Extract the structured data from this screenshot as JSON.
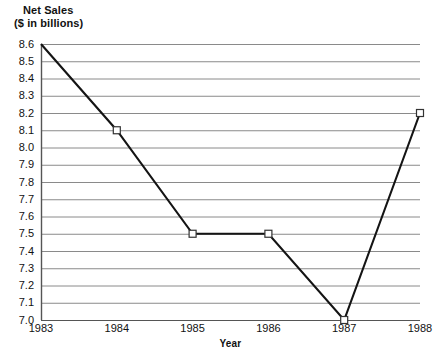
{
  "chart_data": {
    "type": "line",
    "title": "Net Sales ($ in billions)",
    "title_line1": "Net Sales",
    "title_line2": "($ in billions)",
    "xlabel": "Year",
    "ylabel": "",
    "categories": [
      "1983",
      "1984",
      "1985",
      "1986",
      "1987",
      "1988"
    ],
    "x": [
      1983,
      1984,
      1985,
      1986,
      1987,
      1988
    ],
    "values": [
      8.6,
      8.1,
      7.5,
      7.5,
      7.0,
      8.2
    ],
    "series": [
      {
        "name": "Net Sales",
        "values": [
          8.6,
          8.1,
          7.5,
          7.5,
          7.0,
          8.2
        ]
      }
    ],
    "ylim": [
      7.0,
      8.6
    ],
    "ytick_step": 0.1,
    "ytick_labels": [
      "8.6",
      "8.5",
      "8.4",
      "8.3",
      "8.2",
      "8.1",
      "8.0",
      "7.9",
      "7.8",
      "7.7",
      "7.6",
      "7.5",
      "7.4",
      "7.3",
      "7.2",
      "7.1",
      "7.0"
    ],
    "ytick_values": [
      8.6,
      8.5,
      8.4,
      8.3,
      8.2,
      8.1,
      8.0,
      7.9,
      7.8,
      7.7,
      7.6,
      7.5,
      7.4,
      7.3,
      7.2,
      7.1,
      7.0
    ],
    "xtick_labels": [
      "1983",
      "1984",
      "1985",
      "1986",
      "1987",
      "1988"
    ],
    "grid": true,
    "grid_axis": "y",
    "legend": false,
    "legend_position": "none",
    "marker": "open-square",
    "markers_at": [
      "1984",
      "1985",
      "1986",
      "1987",
      "1988"
    ],
    "colors": {
      "line": "#141414",
      "marker_fill": "#ffffff",
      "marker_stroke": "#333333",
      "grid": "#8a8a8a",
      "axis": "#555555",
      "text": "#111111",
      "background": "#ffffff"
    }
  }
}
